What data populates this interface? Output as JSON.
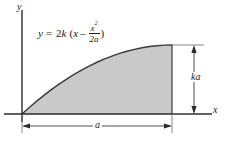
{
  "figure": {
    "type": "math-diagram",
    "background_color": "#ffffff",
    "fill_color": "#c9c9c9",
    "curve_color": "#3b3b3b",
    "axis_color": "#2b2b2b",
    "equation": {
      "lhs": "y",
      "equals": "=",
      "coefficient": "2",
      "k": "k",
      "open_paren": "(",
      "x_term": "x",
      "minus": "–",
      "fraction_numerator": "x",
      "fraction_numerator_exponent": "2",
      "fraction_denominator": "2a",
      "close_paren": ")",
      "plain_text": "y = 2k (x – x²/2a)"
    },
    "axes": {
      "y_label": "y",
      "x_label": "x"
    },
    "dimensions": {
      "horizontal_label": "a",
      "vertical_label": "ka"
    }
  },
  "chart_data": {
    "type": "area",
    "title": "",
    "xlabel": "x",
    "ylabel": "y",
    "grid": false,
    "legend": null,
    "annotations": [
      "y = 2k (x – x²/2a)",
      "a",
      "ka"
    ],
    "function": "y = 2k(x - x^2/(2a))",
    "xlim": [
      0,
      1
    ],
    "ylim": [
      0,
      1
    ],
    "x_units": "fraction of a",
    "y_units": "fraction of ka",
    "x": [
      0,
      0.05,
      0.1,
      0.15,
      0.2,
      0.25,
      0.3,
      0.35,
      0.4,
      0.45,
      0.5,
      0.55,
      0.6,
      0.65,
      0.7,
      0.75,
      0.8,
      0.85,
      0.9,
      0.95,
      1
    ],
    "values": [
      0,
      0.0975,
      0.19,
      0.2775,
      0.36,
      0.4375,
      0.51,
      0.5775,
      0.64,
      0.6975,
      0.75,
      0.7975,
      0.84,
      0.8775,
      0.91,
      0.9375,
      0.96,
      0.9775,
      0.99,
      0.9975,
      1
    ]
  }
}
